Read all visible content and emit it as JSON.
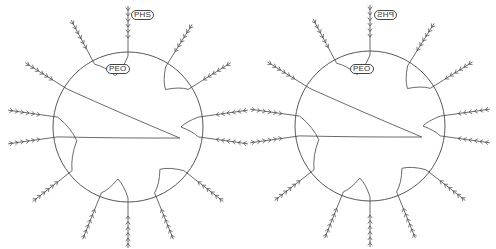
{
  "figure": {
    "line_color": "#444444",
    "panels": [
      {
        "id": "left",
        "center": [
          128,
          127
        ],
        "radius": 75,
        "labels": {
          "outer_block": "PHS",
          "inner_block": "PEO"
        },
        "outer_label_pos": [
          131,
          10
        ],
        "inner_label_pos": [
          106,
          64
        ],
        "outer_label_mirrored": false
      },
      {
        "id": "right",
        "center": [
          370,
          126
        ],
        "radius": 75,
        "labels": {
          "outer_block": "PHS",
          "inner_block": "PEO"
        },
        "outer_label_pos": [
          374,
          10
        ],
        "inner_label_pos": [
          350,
          64
        ],
        "outer_label_mirrored": true
      }
    ],
    "arms_deg": [
      -90,
      -58,
      -118,
      -148,
      -32,
      -8,
      8,
      172,
      188,
      38,
      142,
      68,
      112,
      90
    ],
    "loop_pairs": [
      [
        -90,
        -118
      ],
      [
        -58,
        -32
      ],
      [
        -148,
        172
      ],
      [
        -8,
        8
      ],
      [
        188,
        142
      ],
      [
        38,
        68
      ],
      [
        90,
        112
      ]
    ]
  }
}
